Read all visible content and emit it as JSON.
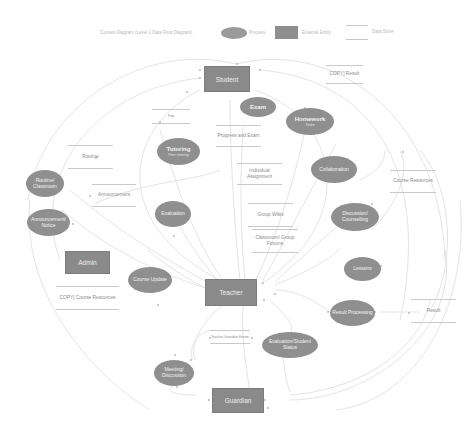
{
  "legend": {
    "title": "Context Diagram (Level 1 Data Flow Diagram)",
    "process_label": "Process",
    "external_entity_label": "External Entity",
    "data_store_label": "Data Store"
  },
  "colors": {
    "process_fill": "#8f8f8f",
    "entity_fill": "#8a8a8a",
    "store_line": "#c9c9c9",
    "flow_line": "#e2e2e2",
    "background": "#ffffff"
  },
  "entities": {
    "student": "Student",
    "admin": "Admin",
    "teacher": "Teacher",
    "guardian": "Guardian"
  },
  "processes": {
    "exam": {
      "title": "Exam"
    },
    "homework": {
      "title": "Homework",
      "sub": "Tasks"
    },
    "tutoring": {
      "title": "Tutoring",
      "sub": "Peer tutoring"
    },
    "collaboration": {
      "title": "Collaboration"
    },
    "routine": {
      "title": "Routine/ Classroom"
    },
    "announcement": {
      "title": "Announcement/ Notice"
    },
    "evaluation": {
      "title": "Evaluation"
    },
    "discussion": {
      "title": "Discussion/ Counselling"
    },
    "course_update": {
      "title": "Course Update"
    },
    "lessons": {
      "title": "Lessons"
    },
    "result_processing": {
      "title": "Result Processing"
    },
    "evaluation_status": {
      "title": "Evaluation/Student Status"
    },
    "meeting": {
      "title": "Meeting/ Discussion"
    }
  },
  "data_stores": {
    "copy_result": "COPY] Result",
    "faq": "Faq",
    "progress_exam": "Progress and Exam",
    "routine": "Routine",
    "announcement": "Announcement",
    "course_resources": "Course Resources",
    "individual_assignment": "Individual Assignment",
    "group_wikis": "Group Wikis",
    "classroom_forums": "Classroom/ Group Forums",
    "copy_course_resources": "COPY] Course Resources",
    "result": "Result",
    "teacher_guardian_forum": "Teacher Guardian Forum"
  }
}
